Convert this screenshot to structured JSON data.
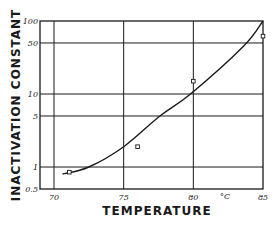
{
  "chart_data": {
    "type": "line",
    "title": "",
    "xlabel": "TEMPERATURE",
    "x_unit_label": "°C",
    "ylabel": "INACTIVATION CONSTANT",
    "xlim": [
      70,
      85
    ],
    "ylim": [
      0.5,
      100
    ],
    "yscale": "log",
    "grid": true,
    "x_ticks": [
      70,
      75,
      80,
      85
    ],
    "x_tick_labels": [
      "70",
      "75",
      "80",
      "85"
    ],
    "y_ticks": [
      0.5,
      1,
      5,
      10,
      50,
      100
    ],
    "y_tick_labels": [
      "0.5",
      "1",
      "5",
      "10",
      "50",
      "100"
    ],
    "series": [
      {
        "name": "measured",
        "style": "open-square-markers",
        "x": [
          71.1,
          76.0,
          80.0,
          85.0
        ],
        "y": [
          0.85,
          1.9,
          15,
          62
        ]
      },
      {
        "name": "fitted curve",
        "style": "solid-line",
        "x": [
          70.6,
          72.5,
          75.0,
          77.6,
          79.8,
          83.6,
          85.0
        ],
        "y": [
          0.8,
          1.0,
          1.9,
          5,
          10,
          45,
          100
        ]
      }
    ]
  }
}
